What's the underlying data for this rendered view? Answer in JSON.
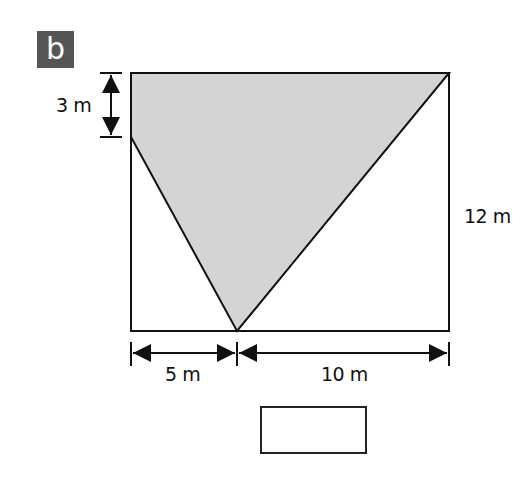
{
  "label": "b",
  "dimensions": {
    "top_left_drop": "3 m",
    "right_height": "12 m",
    "bottom_left": "5 m",
    "bottom_right": "10 m"
  },
  "colors": {
    "shaded": "#d4d4d4",
    "line": "#111111",
    "badge": "#555555"
  },
  "answer_box": {
    "value": ""
  }
}
